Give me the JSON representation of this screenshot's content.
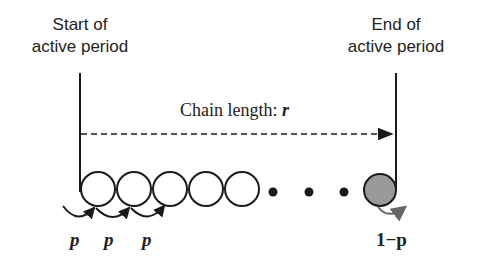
{
  "start_label": {
    "line1": "Start of",
    "line2": "active period"
  },
  "end_label": {
    "line1": "End of",
    "line2": "active period"
  },
  "chain_label": {
    "text": "Chain length: ",
    "var": "r"
  },
  "continue_labels": [
    "p",
    "p",
    "p"
  ],
  "stop_label": "1−p",
  "colors": {
    "stroke": "#1a1a1a",
    "filled_circle": "#9a9a9a",
    "stop_arrow": "#666666"
  },
  "chain": {
    "open_circles": 5,
    "ellipsis_dots": 3,
    "terminal_circle": "filled"
  }
}
